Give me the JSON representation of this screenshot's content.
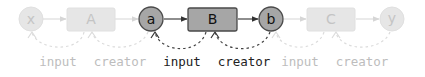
{
  "diagram": {
    "title": "",
    "colors": {
      "faded_fill": "#e6e6e6",
      "faded_stroke": "#e0e0e0",
      "faded_text": "#c4c4c4",
      "faded_edge": "#dcdcdc",
      "active_fill": "#a6a6a6",
      "active_stroke": "#4a4a4a",
      "active_text": "#111111",
      "active_edge": "#444444",
      "label_faded": "#bdbdbd",
      "label_active": "#222222"
    },
    "nodes": [
      {
        "id": "x",
        "shape": "circle",
        "label": "x",
        "state": "faded"
      },
      {
        "id": "A",
        "shape": "box",
        "label": "A",
        "state": "faded"
      },
      {
        "id": "a",
        "shape": "circle",
        "label": "a",
        "state": "active"
      },
      {
        "id": "B",
        "shape": "box",
        "label": "B",
        "state": "active"
      },
      {
        "id": "b",
        "shape": "circle",
        "label": "b",
        "state": "active"
      },
      {
        "id": "C",
        "shape": "box",
        "label": "C",
        "state": "faded"
      },
      {
        "id": "y",
        "shape": "circle",
        "label": "y",
        "state": "faded"
      }
    ],
    "forward_edges": [
      {
        "from": "x",
        "to": "A",
        "state": "faded"
      },
      {
        "from": "A",
        "to": "a",
        "state": "faded"
      },
      {
        "from": "a",
        "to": "B",
        "state": "active"
      },
      {
        "from": "B",
        "to": "b",
        "state": "active"
      },
      {
        "from": "b",
        "to": "C",
        "state": "faded"
      },
      {
        "from": "C",
        "to": "y",
        "state": "faded"
      }
    ],
    "back_edges": [
      {
        "from": "A",
        "to": "x",
        "label": "input",
        "state": "faded"
      },
      {
        "from": "a",
        "to": "A",
        "label": "creator",
        "state": "faded"
      },
      {
        "from": "B",
        "to": "a",
        "label": "input",
        "state": "active"
      },
      {
        "from": "b",
        "to": "B",
        "label": "creator",
        "state": "active"
      },
      {
        "from": "C",
        "to": "b",
        "label": "input",
        "state": "faded"
      },
      {
        "from": "y",
        "to": "C",
        "label": "creator",
        "state": "faded"
      }
    ]
  }
}
